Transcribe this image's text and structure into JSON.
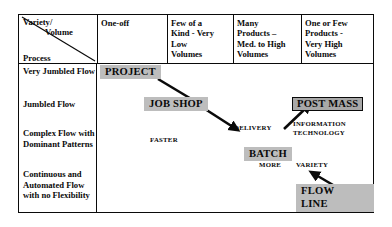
{
  "matrix": {
    "corner": {
      "variety_label": "Variety/",
      "volume_label": "Volume",
      "process_label": "Process",
      "diagonal_icon": "diagonal-divider-line"
    },
    "column_headers": [
      {
        "id": "one-off",
        "label": "One-off"
      },
      {
        "id": "few-of-a-kind",
        "label": "Few of a\nKind - Very\nLow\nVolumes"
      },
      {
        "id": "many-products",
        "label": "Many\nProducts –\nMed. to High\nVolumes"
      },
      {
        "id": "one-or-few-products",
        "label": "One or Few\nProducts -\nVery High\nVolumes"
      }
    ],
    "row_headers": [
      {
        "id": "very-jumbled-flow",
        "label": "Very Jumbled Flow"
      },
      {
        "id": "jumbled-flow",
        "label": "Jumbled Flow"
      },
      {
        "id": "complex-flow",
        "label": "Complex Flow with Dominant Patterns"
      },
      {
        "id": "continuous-flow",
        "label": "Continuous and Automated Flow with no Flexibility"
      }
    ],
    "process_tags": [
      {
        "id": "project",
        "label": "PROJECT",
        "style": "filled"
      },
      {
        "id": "job-shop",
        "label": "JOB SHOP",
        "style": "filled"
      },
      {
        "id": "post-mass",
        "label": "POST MASS",
        "style": "outlined"
      },
      {
        "id": "batch",
        "label": "BATCH",
        "style": "filled"
      },
      {
        "id": "flow-line",
        "label": "FLOW\nLINE",
        "style": "filled"
      }
    ],
    "annotations": [
      {
        "id": "faster",
        "label": "FASTER"
      },
      {
        "id": "delivery",
        "label": "DELIVERY"
      },
      {
        "id": "information-technology",
        "label": "INFORMATION\nTECHNOLOGY"
      },
      {
        "id": "more",
        "label": "MORE"
      },
      {
        "id": "variety",
        "label": "VARIETY"
      }
    ],
    "arrows": [
      {
        "id": "project-to-job-shop",
        "from": "PROJECT",
        "to": "JOB SHOP"
      },
      {
        "id": "job-shop-to-delivery",
        "from": "JOB SHOP",
        "to": "DELIVERY"
      },
      {
        "id": "delivery-to-post-mass",
        "from": "DELIVERY",
        "to": "POST MASS"
      },
      {
        "id": "flow-line-to-variety",
        "from": "FLOW LINE",
        "to": "VARIETY"
      }
    ],
    "colors": {
      "border": "#0a0a0a",
      "tag_fill": "#bdbdbd",
      "tag_fill_dark": "#a8a8a8",
      "text": "#0a0a0a",
      "background": "#ffffff"
    }
  }
}
